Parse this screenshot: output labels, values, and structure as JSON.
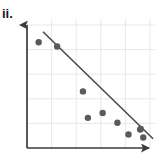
{
  "figure": {
    "label": "ii.",
    "background_color": "#ffffff"
  },
  "chart_data": {
    "type": "scatter",
    "title": "ii.",
    "xlabel": "",
    "ylabel": "",
    "xlim": [
      0,
      10
    ],
    "ylim": [
      0,
      10
    ],
    "grid": true,
    "grid_color": "#e8e8ea",
    "legend": "none",
    "axis_style": "arrow-headed L-axes, no tick labels",
    "axis_color": "#3a3a3c",
    "point_color": "#5a5a5c",
    "point_radius_px": 3.2,
    "x": [
      0.95,
      2.45,
      4.55,
      4.95,
      6.15,
      7.35,
      8.25,
      9.2,
      9.45
    ],
    "y": [
      8.6,
      8.25,
      4.6,
      2.45,
      2.85,
      2.05,
      1.1,
      1.5,
      0.85
    ],
    "points": [
      {
        "x": 0.95,
        "y": 8.6
      },
      {
        "x": 2.45,
        "y": 8.25
      },
      {
        "x": 4.55,
        "y": 4.6
      },
      {
        "x": 4.95,
        "y": 2.45
      },
      {
        "x": 6.15,
        "y": 2.85
      },
      {
        "x": 7.35,
        "y": 2.05
      },
      {
        "x": 8.25,
        "y": 1.1
      },
      {
        "x": 9.2,
        "y": 1.5
      },
      {
        "x": 9.45,
        "y": 0.85
      },
      {
        "x": 9.25,
        "y": 1.55
      }
    ],
    "trend_line": {
      "name": "line of best fit",
      "color": "#4a4a4c",
      "width_px": 1.6,
      "x_start": 1.3,
      "y_start": 9.45,
      "x_end": 10.25,
      "y_end": 0.75
    },
    "gridlines": {
      "vertical_x": [
        2.0,
        4.0,
        6.0,
        8.0,
        10.0
      ],
      "horizontal_y": [
        2.0,
        4.0,
        6.0,
        8.0,
        10.0
      ]
    }
  }
}
